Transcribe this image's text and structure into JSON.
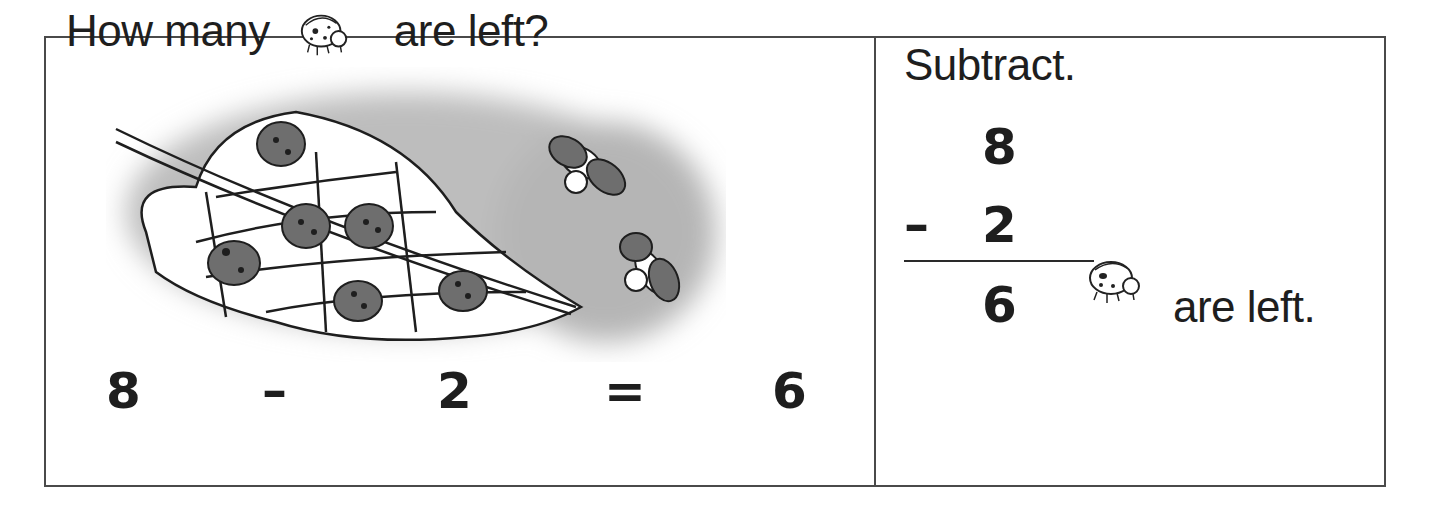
{
  "left_panel": {
    "title_before": "How many",
    "title_icon": "ladybug-icon",
    "title_after": "are left?",
    "illustration": {
      "description": "Leaf with 8 ladybugs; 6 on the leaf, 2 flying away",
      "ladybugs_on_leaf": 6,
      "ladybugs_flying_away": 2
    },
    "equation": {
      "minuend": "8",
      "minus": "–",
      "subtrahend": "2",
      "equals": "=",
      "result": "6"
    }
  },
  "right_panel": {
    "title": "Subtract.",
    "vertical": {
      "top": "8",
      "operator": "–",
      "bottom": "2",
      "answer": "6"
    },
    "answer_icon": "ladybug-icon",
    "answer_text": "are left."
  },
  "colors": {
    "border": "#4a4a4a",
    "text": "#1e1e1e",
    "background_wash": "#bdbdbd",
    "ladybug_shell": "#6e6e6e"
  }
}
